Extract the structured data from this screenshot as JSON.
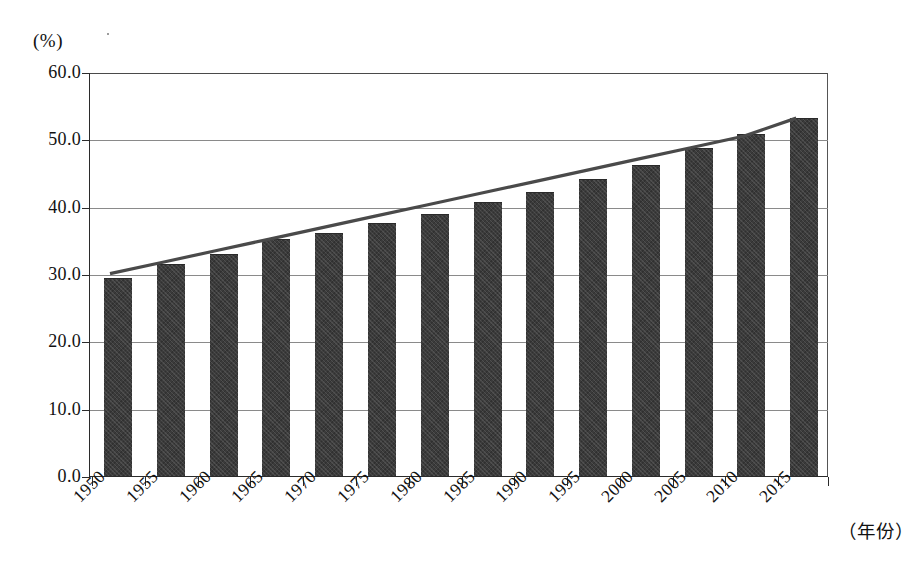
{
  "chart_data": {
    "type": "bar",
    "title": "",
    "xlabel": "（年份）",
    "ylabel": "(%)",
    "categories": [
      "1950",
      "1955",
      "1960",
      "1965",
      "1970",
      "1975",
      "1980",
      "1985",
      "1990",
      "1995",
      "2000",
      "2005",
      "2010",
      "2015"
    ],
    "values": [
      29.3,
      31.3,
      32.8,
      35.0,
      36.0,
      37.5,
      38.8,
      40.5,
      42.0,
      44.0,
      46.0,
      48.5,
      50.7,
      53.0
    ],
    "ylim": [
      0.0,
      60.0
    ],
    "ytick_labels": [
      "60.0",
      "50.0",
      "40.0",
      "30.0",
      "20.0",
      "10.0",
      "0.0"
    ],
    "ytick_values": [
      60.0,
      50.0,
      40.0,
      30.0,
      20.0,
      10.0,
      0.0
    ],
    "grid": true,
    "legend": "none",
    "series": [
      {
        "name": "bars",
        "type": "bar",
        "values": [
          29.3,
          31.3,
          32.8,
          35.0,
          36.0,
          37.5,
          38.8,
          40.5,
          42.0,
          44.0,
          46.0,
          48.5,
          50.7,
          53.0
        ]
      },
      {
        "name": "trendline",
        "type": "line",
        "values": [
          30.2,
          31.9,
          33.6,
          35.3,
          37.0,
          38.7,
          40.4,
          42.1,
          43.8,
          45.5,
          47.2,
          48.9,
          50.6,
          53.3
        ]
      }
    ]
  },
  "style": {
    "bar_color": "#3b3b3b",
    "trend_color": "#4a4a4a",
    "grid_color": "#8a8a8a",
    "axis_color": "#2b2b2b",
    "background": "#ffffff"
  }
}
